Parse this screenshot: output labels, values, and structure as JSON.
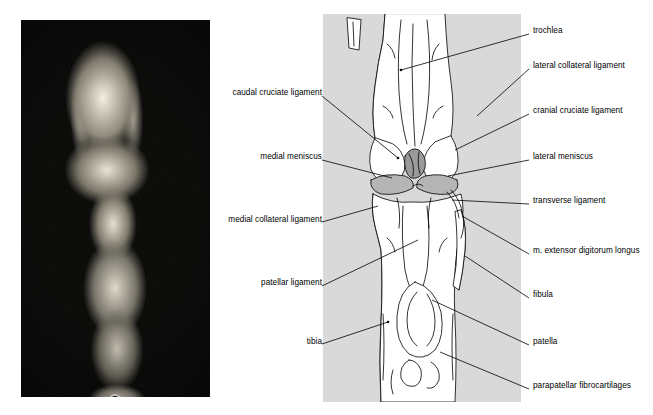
{
  "figure": {
    "panels": {
      "photo": {
        "name": "cadaver-dissection-photograph"
      },
      "drawing": {
        "name": "labelled-line-drawing"
      }
    }
  },
  "labels_left": [
    {
      "id": "caudal-cruciate-ligament",
      "text": "caudal cruciate ligament",
      "x": 226,
      "y": 92,
      "line": [
        323,
        96,
        398,
        158
      ]
    },
    {
      "id": "medial-meniscus",
      "text": "medial meniscus",
      "x": 256,
      "y": 156,
      "line": [
        323,
        160,
        392,
        178
      ]
    },
    {
      "id": "medial-collateral-ligament",
      "text": "medial collateral ligament",
      "x": 226,
      "y": 219,
      "line": [
        323,
        222,
        378,
        205
      ]
    },
    {
      "id": "patellar-ligament",
      "text": "patellar ligament",
      "x": 252,
      "y": 282,
      "line": [
        323,
        286,
        418,
        240
      ]
    },
    {
      "id": "tibia",
      "text": "tibia",
      "x": 295,
      "y": 341,
      "line": [
        323,
        344,
        388,
        322
      ]
    }
  ],
  "labels_right": [
    {
      "id": "trochlea",
      "text": "trochlea",
      "x": 533,
      "y": 30,
      "line": [
        530,
        34,
        401,
        70
      ]
    },
    {
      "id": "lateral-collateral-ligament",
      "text": "lateral collateral ligament",
      "x": 533,
      "y": 65,
      "line": [
        530,
        69,
        478,
        116
      ]
    },
    {
      "id": "cranial-cruciate-ligament",
      "text": "cranial cruciate ligament",
      "x": 533,
      "y": 110,
      "line": [
        530,
        114,
        455,
        150
      ]
    },
    {
      "id": "lateral-meniscus",
      "text": "lateral meniscus",
      "x": 533,
      "y": 156,
      "line": [
        530,
        160,
        448,
        176
      ]
    },
    {
      "id": "transverse-ligament",
      "text": "transverse ligament",
      "x": 533,
      "y": 200,
      "line": [
        530,
        204,
        452,
        200
      ]
    },
    {
      "id": "m-extensor-digitorum-longus",
      "text": "m. extensor digitorum longus",
      "x": 533,
      "y": 250,
      "line": [
        530,
        254,
        462,
        216
      ]
    },
    {
      "id": "fibula",
      "text": "fibula",
      "x": 533,
      "y": 294,
      "line": [
        530,
        298,
        465,
        256
      ]
    },
    {
      "id": "patella",
      "text": "patella",
      "x": 533,
      "y": 341,
      "line": [
        530,
        345,
        432,
        300
      ]
    },
    {
      "id": "parapatellar-fibrocartilages",
      "text": "parapatellar fibrocartilages",
      "x": 533,
      "y": 385,
      "line": [
        530,
        389,
        440,
        352
      ]
    }
  ],
  "colors": {
    "panel_background": "#d9d9d9",
    "photo_background": "#0b0b0a",
    "line": "#000000",
    "bone_fill": "#ffffff",
    "cartilage_fill": "#b0b0b0",
    "page_background": "#ffffff"
  }
}
